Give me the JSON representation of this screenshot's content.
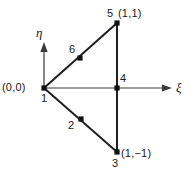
{
  "figure": {
    "background_color": "#ffffff",
    "line_color": "#2a2a2a",
    "text_color": "#1a1a1a"
  },
  "axes": {
    "horizontal": {
      "label": "ξ",
      "name": "xi-axis",
      "direction": "right"
    },
    "vertical": {
      "label": "η",
      "name": "eta-axis",
      "direction": "up"
    }
  },
  "nodes": [
    {
      "id": "1",
      "label": "1",
      "coord_label": "(0,0)",
      "x": 44,
      "y": 88
    },
    {
      "id": "2",
      "label": "2",
      "coord_label": "",
      "x": 81,
      "y": 119
    },
    {
      "id": "3",
      "label": "3",
      "coord_label": "(1,−1)",
      "x": 117,
      "y": 152
    },
    {
      "id": "4",
      "label": "4",
      "coord_label": "",
      "x": 117,
      "y": 88
    },
    {
      "id": "5",
      "label": "5",
      "coord_label": "(1,1)",
      "x": 117,
      "y": 23
    },
    {
      "id": "6",
      "label": "6",
      "coord_label": "",
      "x": 80,
      "y": 58
    }
  ],
  "edges": [
    {
      "name": "edge-1-to-5",
      "from": "1",
      "to": "5"
    },
    {
      "name": "edge-1-to-3",
      "from": "1",
      "to": "3"
    },
    {
      "name": "edge-5-to-3",
      "from": "5",
      "to": "3"
    }
  ],
  "labels": {
    "origin_coord": "(0,0)",
    "node1": "1",
    "node2": "2",
    "node3": "3",
    "node3_coord": "(1,−1)",
    "node4": "4",
    "node5": "5",
    "node5_coord": "(1,1)",
    "node6": "6",
    "xi": "ξ",
    "eta": "η"
  }
}
